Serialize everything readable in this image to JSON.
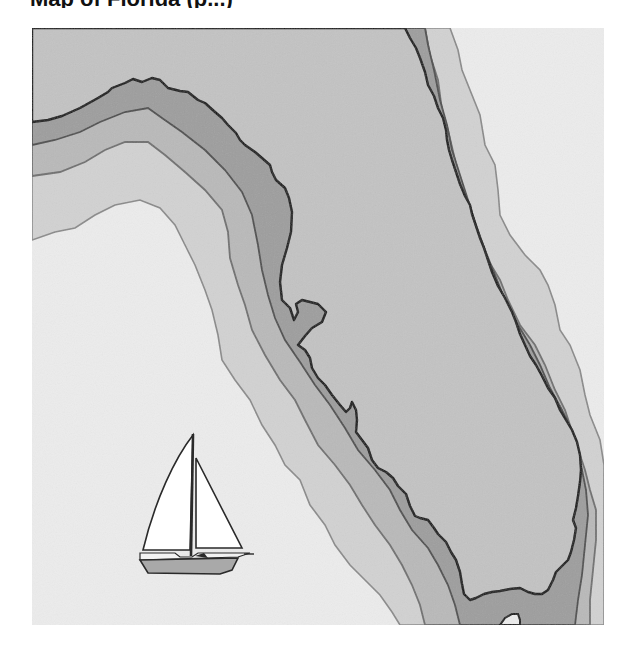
{
  "header": {
    "title_fragment": "Map of Florida (p...)"
  },
  "map": {
    "subject": "Florida peninsula and panhandle coastline with depth contour bands",
    "colors": {
      "land": "#c3c3c3",
      "band_shallow": "#9e9e9e",
      "band_middle": "#b9b9b9",
      "band_outer": "#d2d2d2",
      "open_water": "#ececec",
      "coastline": "#111111",
      "contour_line": "#7a7a7a"
    },
    "icons": [
      {
        "name": "sailboat-icon",
        "hull_color": "#a9a9a9",
        "sail_color": "#ffffff"
      }
    ]
  }
}
